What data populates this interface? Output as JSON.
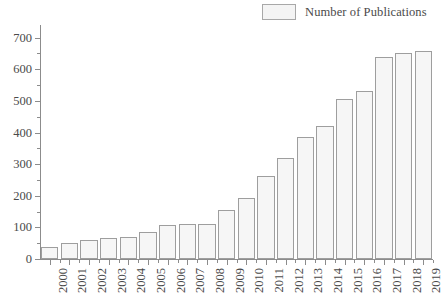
{
  "chart_data": {
    "type": "bar",
    "title": "",
    "subtitle": "",
    "xlabel": "",
    "ylabel": "",
    "categories": [
      "2000",
      "2001",
      "2002",
      "2003",
      "2004",
      "2005",
      "2006",
      "2007",
      "2008",
      "2009",
      "2010",
      "2011",
      "2012",
      "2013",
      "2014",
      "2015",
      "2016",
      "2017",
      "2018",
      "2019"
    ],
    "values": [
      37,
      52,
      60,
      67,
      70,
      84,
      107,
      111,
      112,
      155,
      192,
      263,
      321,
      387,
      420,
      507,
      532,
      639,
      651,
      657
    ],
    "series": [
      {
        "name": "Number of Publications",
        "values": [
          37,
          52,
          60,
          67,
          70,
          84,
          107,
          111,
          112,
          155,
          192,
          263,
          321,
          387,
          420,
          507,
          532,
          639,
          651,
          657
        ]
      }
    ],
    "ylim": [
      0,
      740
    ],
    "ytick_values": [
      0,
      100,
      200,
      300,
      400,
      500,
      600,
      700
    ],
    "ytick_labels": [
      "0",
      "100",
      "200",
      "300",
      "400",
      "500",
      "600",
      "700"
    ],
    "yminor_tick_values": [
      50,
      150,
      250,
      350,
      450,
      550,
      650
    ],
    "grid": false,
    "legend_position": "top-right",
    "bar_fill_color": "#f6f6f6",
    "bar_edge_color": "#9e9e9e",
    "axis_color": "#8c8c8c",
    "text_color": "#4a4a4a"
  },
  "legend": {
    "entries": [
      {
        "label": "Number of Publications",
        "swatch_color": "#f4f4f4"
      }
    ]
  }
}
